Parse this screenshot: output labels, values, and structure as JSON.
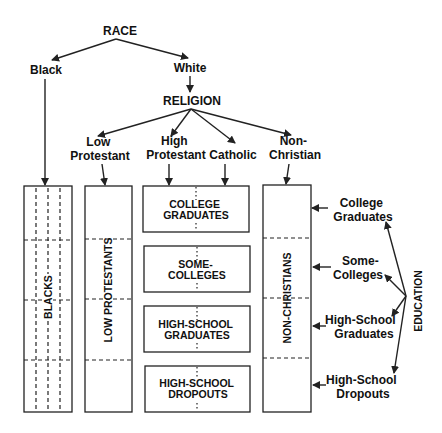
{
  "diagram": {
    "root": "RACE",
    "race_branches": [
      "Black",
      "White"
    ],
    "religion_label": "RELIGION",
    "religion_branches": [
      {
        "line1": "Low",
        "line2": "Protestant"
      },
      {
        "line1": "High",
        "line2": "Protestant"
      },
      {
        "line1": "",
        "line2": "Catholic"
      },
      {
        "line1": "Non-",
        "line2": "Christian"
      }
    ],
    "column_labels": {
      "blacks": "BLACKS",
      "low_protestants": "LOW PROTESTANTS",
      "non_christians": "NON-CHRISTIANS"
    },
    "education_boxes": [
      {
        "line1": "COLLEGE",
        "line2": "GRADUATES"
      },
      {
        "line1": "SOME-",
        "line2": "COLLEGES"
      },
      {
        "line1": "HIGH-SCHOOL",
        "line2": "GRADUATES"
      },
      {
        "line1": "HIGH-SCHOOL",
        "line2": "DROPOUTS"
      }
    ],
    "education_label": "EDUCATION",
    "education_levels": [
      {
        "line1": "College",
        "line2": "Graduates"
      },
      {
        "line1": "Some-",
        "line2": "Colleges"
      },
      {
        "line1": "High-School",
        "line2": "Graduates"
      },
      {
        "line1": "High-School",
        "line2": "Dropouts"
      }
    ]
  }
}
